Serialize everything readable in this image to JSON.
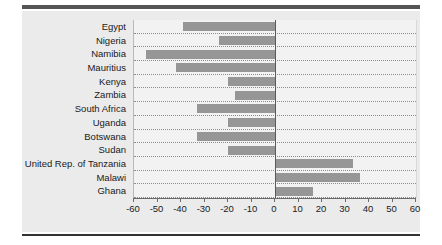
{
  "chart_data": {
    "type": "bar",
    "orientation": "horizontal",
    "title": "",
    "subtitle": "",
    "xlabel": "",
    "ylabel": "",
    "xlim": [
      -60,
      60
    ],
    "xticks": [
      -60,
      -50,
      -40,
      -30,
      -20,
      -10,
      0,
      10,
      20,
      30,
      40,
      50,
      60
    ],
    "xticklabels": [
      "-60",
      "-50",
      "-40",
      "-30",
      "-20",
      "-10",
      "0",
      "10",
      "20",
      "30",
      "40",
      "50",
      "60"
    ],
    "grid": "horizontal-dotted",
    "legend": "none",
    "zero_reference_line": true,
    "categories": [
      "Egypt",
      "Nigeria",
      "Namibia",
      "Mauritius",
      "Kenya",
      "Zambia",
      "South Africa",
      "Uganda",
      "Botswana",
      "Sudan",
      "United Rep. of Tanzania",
      "Malawi",
      "Ghana"
    ],
    "values": [
      -39,
      -24,
      -55,
      -42,
      -20,
      -17,
      -33,
      -20,
      -33,
      -20,
      33,
      36,
      16
    ],
    "series": [
      {
        "name": "value",
        "values": [
          -39,
          -24,
          -55,
          -42,
          -20,
          -17,
          -33,
          -20,
          -33,
          -20,
          33,
          36,
          16
        ]
      }
    ],
    "colors": {
      "bar": "#969696",
      "panel": "#ebebeb",
      "plot_area": "#f2f2f2",
      "gridline": "#8d8d8d",
      "axis": "#6b6b6b",
      "rule": "#555555",
      "text": "#1a1a1a"
    }
  }
}
